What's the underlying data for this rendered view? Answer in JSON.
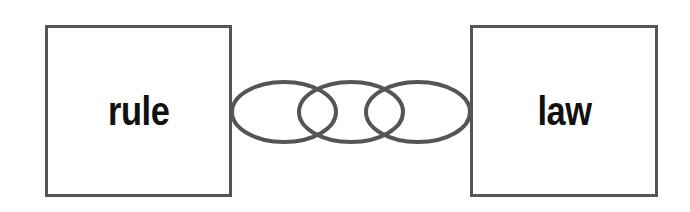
{
  "diagram": {
    "type": "concept-link-diagram",
    "canvas": {
      "width": 690,
      "height": 212,
      "background": "#ffffff"
    },
    "stroke_color": "#555555",
    "text_color": "#111111",
    "nodes": [
      {
        "id": "left",
        "label": "rule",
        "x": 45,
        "y": 25,
        "width": 187,
        "height": 172,
        "border_width": 3
      },
      {
        "id": "right",
        "label": "law",
        "x": 470,
        "y": 25,
        "width": 188,
        "height": 172,
        "border_width": 3
      }
    ],
    "connector": {
      "name": "chain-link-connector",
      "shape": "interlocking-ellipses",
      "count": 3,
      "center_y": 112,
      "ellipse_rx": 52,
      "ellipse_ry": 30,
      "centers_x": [
        284,
        351,
        418
      ],
      "stroke_width": 4,
      "fill": "none"
    }
  }
}
